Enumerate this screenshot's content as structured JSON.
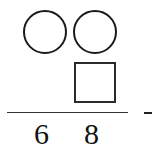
{
  "puzzle": {
    "type": "vertical-arithmetic",
    "rows": [
      {
        "cells": [
          "circle",
          "circle"
        ],
        "role": "top-operand"
      },
      {
        "cells": [
          "",
          "square"
        ],
        "role": "second-operand"
      }
    ],
    "operator": "-",
    "result": {
      "digits": [
        "6",
        "8"
      ]
    }
  }
}
